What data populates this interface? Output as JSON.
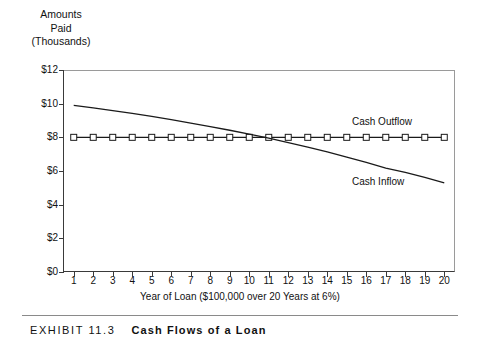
{
  "axis_heading": {
    "line1": "Amounts",
    "line2": "Paid",
    "line3": "(Thousands)"
  },
  "caption": {
    "exhibit_label": "EXHIBIT 11.3",
    "title": "Cash Flows of a Loan"
  },
  "chart_data": {
    "type": "line",
    "title": "Cash Flows of a Loan",
    "xlabel": "Year of Loan ($100,000 over 20 Years at 6%)",
    "ylabel": "Amounts Paid (Thousands)",
    "x": [
      1,
      2,
      3,
      4,
      5,
      6,
      7,
      8,
      9,
      10,
      11,
      12,
      13,
      14,
      15,
      16,
      17,
      18,
      19,
      20
    ],
    "xlim": [
      0.45,
      20.55
    ],
    "ylim": [
      0,
      12
    ],
    "ytick_labels": [
      "$0",
      "$2",
      "$4",
      "$6",
      "$8",
      "$10",
      "$12"
    ],
    "ytick_values": [
      0,
      2,
      4,
      6,
      8,
      10,
      12
    ],
    "xtick_labels": [
      "1",
      "2",
      "3",
      "4",
      "5",
      "6",
      "7",
      "8",
      "9",
      "10",
      "11",
      "12",
      "13",
      "14",
      "15",
      "16",
      "17",
      "18",
      "19",
      "20"
    ],
    "grid": false,
    "legend": "inline-annotations",
    "series": [
      {
        "name": "Cash Outflow",
        "marker": "square",
        "values": [
          8.0,
          8.0,
          8.0,
          8.0,
          8.0,
          8.0,
          8.0,
          8.0,
          8.0,
          8.0,
          8.0,
          8.0,
          8.0,
          8.0,
          8.0,
          8.0,
          8.0,
          8.0,
          8.0,
          8.0
        ]
      },
      {
        "name": "Cash Inflow",
        "marker": "none",
        "values": [
          9.9,
          9.75,
          9.59,
          9.42,
          9.24,
          9.05,
          8.85,
          8.64,
          8.42,
          8.19,
          7.95,
          7.69,
          7.42,
          7.13,
          6.83,
          6.51,
          6.17,
          5.92,
          5.62,
          5.3
        ]
      }
    ]
  }
}
